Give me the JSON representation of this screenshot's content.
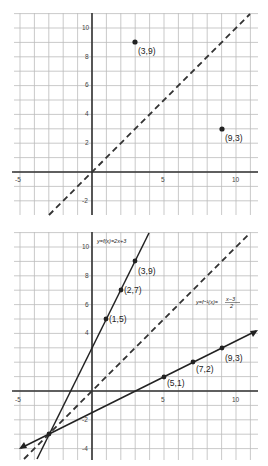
{
  "chart_data": [
    {
      "type": "scatter",
      "title": "",
      "xlabel": "",
      "ylabel": "",
      "xlim": [
        -5,
        11.5
      ],
      "ylim": [
        -2.9,
        11
      ],
      "grid": true,
      "xticks": [
        "-5",
        "5",
        "10"
      ],
      "yticks": [
        "-2",
        "2",
        "4",
        "6",
        "8",
        "10"
      ],
      "series": [
        {
          "name": "y=x",
          "style": "dashed",
          "x": [
            -3,
            11
          ],
          "y": [
            -3,
            11
          ]
        },
        {
          "name": "points",
          "style": "markers",
          "points": [
            {
              "x": 3,
              "y": 9,
              "label": "(3,9)"
            },
            {
              "x": 9,
              "y": 3,
              "label": "(9,3)"
            }
          ]
        }
      ]
    },
    {
      "type": "line",
      "title": "",
      "xlabel": "",
      "ylabel": "",
      "xlim": [
        -5,
        11.5
      ],
      "ylim": [
        -4.5,
        11
      ],
      "grid": true,
      "xticks": [
        "-5",
        "5",
        "10"
      ],
      "yticks": [
        "-4",
        "-2",
        "2",
        "4",
        "6",
        "8",
        "10"
      ],
      "series": [
        {
          "name": "y=f(x)=2x+3",
          "style": "solid",
          "points": [
            {
              "x": 1,
              "y": 5,
              "label": "(1,5)"
            },
            {
              "x": 2,
              "y": 7,
              "label": "(2,7)"
            },
            {
              "x": 3,
              "y": 9,
              "label": "(3,9)"
            }
          ]
        },
        {
          "name": "y=f⁻¹(x)=(x−3)/2",
          "style": "solid-arrow",
          "points": [
            {
              "x": 5,
              "y": 1,
              "label": "(5,1)"
            },
            {
              "x": 7,
              "y": 2,
              "label": "(7,2)"
            },
            {
              "x": 9,
              "y": 3,
              "label": "(9,3)"
            }
          ]
        },
        {
          "name": "y=x",
          "style": "dashed",
          "x": [
            -4.5,
            11
          ],
          "y": [
            -4.5,
            11
          ]
        }
      ],
      "annotations": [
        "y=f(x)=2x+3",
        "y=f⁻¹(x)=(x−3)/2"
      ]
    }
  ],
  "top": {
    "ticks_x": [
      "-5",
      "5",
      "10"
    ],
    "ticks_y": [
      "10",
      "8",
      "6",
      "4",
      "2",
      "-2"
    ],
    "labels": [
      "(3,9)",
      "(9,3)"
    ]
  },
  "bottom": {
    "ticks_x": [
      "-5",
      "5",
      "10"
    ],
    "ticks_y": [
      "10",
      "8",
      "6",
      "4",
      "-2",
      "-4"
    ],
    "labels": [
      "(3,9)",
      "(2,7)",
      "(1,5)",
      "(5,1)",
      "(7,2)",
      "(9,3)"
    ],
    "f_label": "y=f(x)=2x+3",
    "finv_label_left": "y=f⁻¹(x)=",
    "finv_num": "x−3",
    "finv_den": "2"
  }
}
